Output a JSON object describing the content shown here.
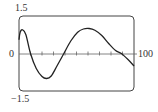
{
  "chart_data": {
    "type": "line",
    "title": "",
    "xlabel": "",
    "ylabel": "",
    "xlim": [
      0,
      100
    ],
    "ylim": [
      -1.5,
      1.5
    ],
    "grid": false,
    "legend": null,
    "tick_labels": {
      "y_top": "1.5",
      "y_bottom": "−1.5",
      "origin": "0",
      "x_right": "100"
    },
    "x_tick_interval": 10,
    "series": [
      {
        "name": "curve",
        "x": [
          0,
          1,
          3,
          6,
          10,
          15,
          20,
          24,
          28,
          33,
          39,
          45,
          51,
          56,
          61,
          66,
          72,
          78,
          84,
          89,
          95,
          100
        ],
        "y": [
          0.55,
          0.85,
          0.95,
          0.75,
          0.0,
          -0.6,
          -0.92,
          -1.0,
          -0.9,
          -0.5,
          0.0,
          0.5,
          0.85,
          0.98,
          1.0,
          0.93,
          0.72,
          0.4,
          0.12,
          0.0,
          -0.25,
          -0.5
        ]
      }
    ]
  },
  "colors": {
    "curve": "#222222",
    "frame": "#444444",
    "axis": "#666666"
  }
}
